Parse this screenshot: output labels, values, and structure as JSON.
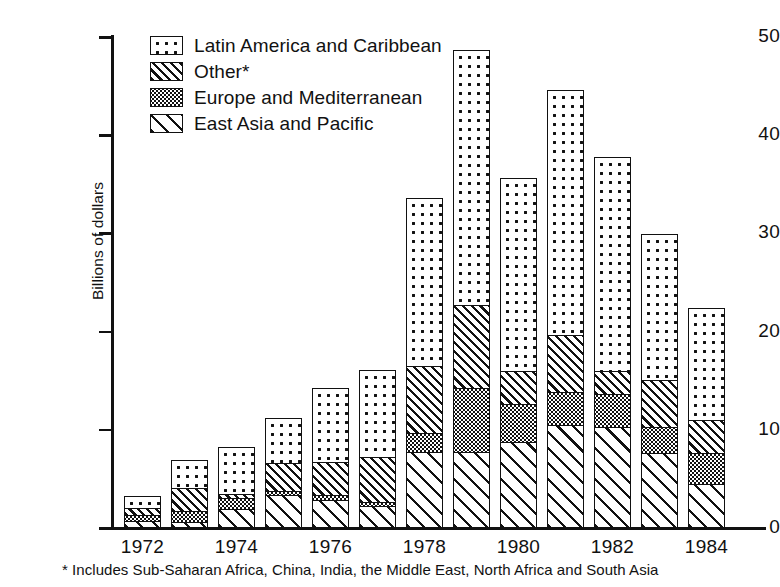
{
  "chart_data": {
    "type": "bar",
    "subtype": "stacked-vertical",
    "title": "",
    "xlabel": "",
    "ylabel": "Billions of dollars",
    "ylim": [
      0,
      50
    ],
    "yticks": [
      0,
      10,
      20,
      30,
      40,
      50
    ],
    "ytick_labels": [
      "0",
      "10",
      "20",
      "30",
      "40",
      "50"
    ],
    "grid": false,
    "legend_position": "upper-left-inside",
    "stack_order_bottom_to_top": [
      "East Asia and Pacific",
      "Europe and Mediterranean",
      "Other*",
      "Latin America and Caribbean"
    ],
    "categories": [
      "1972",
      "1973",
      "1974",
      "1975",
      "1976",
      "1977",
      "1978",
      "1979",
      "1980",
      "1981",
      "1982",
      "1983",
      "1984"
    ],
    "xtick_labels_shown": [
      "1972",
      "1974",
      "1976",
      "1978",
      "1980",
      "1982",
      "1984"
    ],
    "series": [
      {
        "name": "East Asia and Pacific",
        "pattern": "wide-diagonal-stripes",
        "values": [
          0.8,
          0.7,
          2.0,
          3.4,
          2.9,
          2.3,
          7.8,
          7.8,
          8.8,
          10.5,
          10.3,
          7.7,
          4.5
        ]
      },
      {
        "name": "Europe and Mediterranean",
        "pattern": "fine-dot-grid",
        "values": [
          0.8,
          1.3,
          1.3,
          0.6,
          0.7,
          0.6,
          2.1,
          6.7,
          4.1,
          3.6,
          3.6,
          2.8,
          3.4
        ]
      },
      {
        "name": "Other*",
        "pattern": "narrow-dense-hatch",
        "values": [
          0.8,
          2.5,
          0.5,
          3.0,
          3.5,
          4.7,
          7.0,
          8.6,
          3.5,
          5.9,
          2.5,
          5.0,
          3.5
        ]
      },
      {
        "name": "Latin America and Caribbean",
        "pattern": "sparse-dots",
        "values": [
          1.4,
          2.9,
          4.9,
          4.7,
          7.6,
          9.0,
          17.2,
          26.1,
          19.7,
          25.1,
          21.9,
          14.9,
          11.5
        ]
      }
    ],
    "totals": [
      3.8,
      7.4,
      8.7,
      11.7,
      14.7,
      16.6,
      34.1,
      49.2,
      36.1,
      45.1,
      38.3,
      30.4,
      22.9
    ],
    "annotations": [
      "* Includes Sub-Saharan Africa, China, India, the Middle East, North Africa and South Asia"
    ]
  },
  "legend": {
    "items": [
      {
        "label": "Latin America and Caribbean",
        "swatch": "sparse-dots-swatch"
      },
      {
        "label": "Other*",
        "swatch": "narrow-dense-hatch-swatch"
      },
      {
        "label": "Europe and Mediterranean",
        "swatch": "fine-dot-grid-swatch"
      },
      {
        "label": "East Asia and Pacific",
        "swatch": "wide-diagonal-stripes-swatch"
      }
    ]
  },
  "axes": {
    "y_title": "Billions of dollars",
    "y_labels": [
      "50",
      "40",
      "30",
      "20",
      "10",
      "0"
    ],
    "x_labels": [
      "1972",
      "1974",
      "1976",
      "1978",
      "1980",
      "1982",
      "1984"
    ]
  },
  "footnote": "* Includes Sub-Saharan Africa, China, India, the Middle East, North Africa and South Asia",
  "colors": {
    "ink": "#111111",
    "paper": "#ffffff"
  }
}
